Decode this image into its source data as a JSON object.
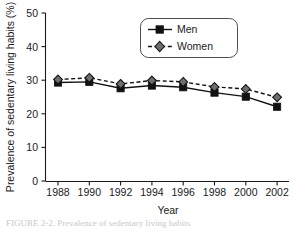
{
  "chart_data": {
    "type": "line",
    "title": "",
    "xlabel": "Year",
    "ylabel": "Prevalence of sedentary living habits (%)",
    "x": [
      1988,
      1990,
      1992,
      1994,
      1996,
      1998,
      2000,
      2002
    ],
    "categories": [
      "1988",
      "1990",
      "1992",
      "1994",
      "1996",
      "1998",
      "2000",
      "2002"
    ],
    "series": [
      {
        "name": "Men",
        "values": [
          29.3,
          29.5,
          27.6,
          28.4,
          27.9,
          26.3,
          25.1,
          22.1
        ],
        "marker": "square",
        "line_style": "solid",
        "color": "#121212"
      },
      {
        "name": "Women",
        "values": [
          30.2,
          30.7,
          28.9,
          29.9,
          29.5,
          28.0,
          27.4,
          24.9
        ],
        "marker": "diamond",
        "line_style": "dashed",
        "color": "#6e6e6e"
      }
    ],
    "ylim": [
      0,
      50
    ],
    "yticks": [
      0,
      10,
      20,
      30,
      40,
      50
    ],
    "ytick_labels": [
      "0",
      "10",
      "20",
      "30",
      "40",
      "50"
    ],
    "xlim": [
      1987,
      2003
    ],
    "grid": false,
    "legend_position": "top-center",
    "legend_entries": [
      "Men",
      "Women"
    ]
  },
  "caption": {
    "text": "FIGURE 2-2.  Prevalence of sedentary living habits"
  }
}
